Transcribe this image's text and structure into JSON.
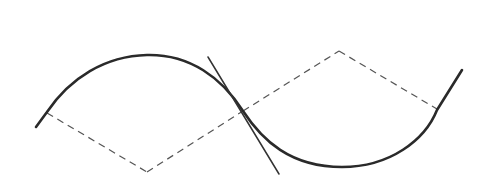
{
  "diagram": {
    "colors": {
      "curve": "#2a2a2a",
      "tangent": "#333333",
      "radius": "#555555",
      "background": "#ffffff"
    },
    "curve_path": "M 36 127 L 47 112 C 70 78, 105 56, 147 55 C 190 54, 222 78, 243 111 C 262 140, 290 167, 342 167 C 390 167, 425 140, 437 110 L 462 70",
    "tangent_line": {
      "x1": 208,
      "y1": 57,
      "x2": 279,
      "y2": 174
    },
    "radii_lines": [
      {
        "x1": 47,
        "y1": 113,
        "x2": 147,
        "y2": 172
      },
      {
        "x1": 147,
        "y1": 172,
        "x2": 243,
        "y2": 111
      },
      {
        "x1": 243,
        "y1": 111,
        "x2": 339,
        "y2": 51
      },
      {
        "x1": 339,
        "y1": 51,
        "x2": 437,
        "y2": 109
      }
    ]
  }
}
